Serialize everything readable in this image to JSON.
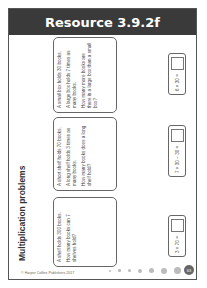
{
  "header": {
    "title": "Resource 3.9.2f"
  },
  "section_title": "Multiplication problems",
  "problems": [
    {
      "lines": [
        "A shelf holds 300 books.",
        "How many books can 7 shelves hold?"
      ]
    },
    {
      "lines": [
        "A short shelf holds 70 books.",
        "A long shelf holds 3 times as many books.",
        "How many books does a long shelf hold?"
      ]
    },
    {
      "lines": [
        "A small box holds 30 books.",
        "A large box holds 7 times as many books.",
        "How many more books are there in a large box than a small box?"
      ]
    }
  ],
  "answers": [
    {
      "expression": "3 × 70 ="
    },
    {
      "expression": "7 × 30 − 30 ="
    },
    {
      "expression": "6 × 30 ="
    }
  ],
  "footer": {
    "copyright": "© Harper Collins Publishers 2017",
    "page_number": "63"
  },
  "colors": {
    "header_bg": "#3a3a3a",
    "border": "#666666"
  }
}
